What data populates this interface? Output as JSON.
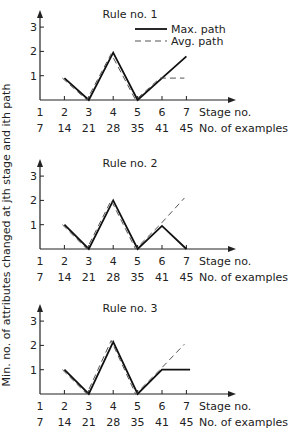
{
  "figure": {
    "ylabel": "Min. no. of attributes changed at jth stage and ith path",
    "legend": {
      "max_label": "Max. path",
      "avg_label": "Avg. path"
    }
  },
  "chart_data": [
    {
      "type": "line",
      "title": "Rule no. 1",
      "xlabel": "Stage no.",
      "xlabel2": "No. of examples",
      "categories": [
        "1",
        "2",
        "3",
        "4",
        "5",
        "6",
        "7"
      ],
      "examples": [
        "7",
        "14",
        "21",
        "28",
        "35",
        "41",
        "45"
      ],
      "ylim": [
        0,
        3
      ],
      "yticks": [
        "1",
        "2",
        "3"
      ],
      "series": [
        {
          "name": "Max. path",
          "x": [
            2,
            3,
            4,
            5,
            6,
            7
          ],
          "values": [
            0.9,
            0,
            1.95,
            0,
            0.9,
            1.8
          ]
        },
        {
          "name": "Avg. path",
          "x": [
            2,
            3,
            4,
            5,
            6,
            7
          ],
          "values": [
            0.9,
            0,
            1.9,
            0,
            0.9,
            0.9
          ]
        }
      ]
    },
    {
      "type": "line",
      "title": "Rule no. 2",
      "xlabel": "Stage no.",
      "xlabel2": "No. of examples",
      "categories": [
        "1",
        "2",
        "3",
        "4",
        "5",
        "6",
        "7"
      ],
      "examples": [
        "7",
        "14",
        "21",
        "28",
        "35",
        "41",
        "45"
      ],
      "ylim": [
        0,
        3
      ],
      "yticks": [
        "1",
        "2",
        "3"
      ],
      "series": [
        {
          "name": "Max. path",
          "x": [
            2,
            3,
            4,
            5,
            6,
            7
          ],
          "values": [
            1,
            0,
            2,
            0,
            0.95,
            0
          ]
        },
        {
          "name": "Avg. path",
          "x": [
            2,
            3,
            4,
            5,
            6,
            7
          ],
          "values": [
            1,
            0,
            2,
            0,
            1,
            2.1
          ]
        }
      ]
    },
    {
      "type": "line",
      "title": "Rule no. 3",
      "xlabel": "Stage no.",
      "xlabel2": "No. of examples",
      "categories": [
        "1",
        "2",
        "3",
        "4",
        "5",
        "6",
        "7"
      ],
      "examples": [
        "7",
        "14",
        "21",
        "28",
        "35",
        "41",
        "45"
      ],
      "ylim": [
        0,
        3
      ],
      "yticks": [
        "1",
        "2",
        "3"
      ],
      "series": [
        {
          "name": "Max. path",
          "x": [
            2,
            3,
            4,
            5,
            6,
            7,
            7.15
          ],
          "values": [
            1,
            0,
            2.15,
            0,
            1,
            1,
            1
          ]
        },
        {
          "name": "Avg. path",
          "x": [
            2,
            3,
            4,
            5,
            6,
            7
          ],
          "values": [
            1,
            0,
            2.2,
            0,
            1,
            2.05
          ]
        }
      ]
    }
  ]
}
